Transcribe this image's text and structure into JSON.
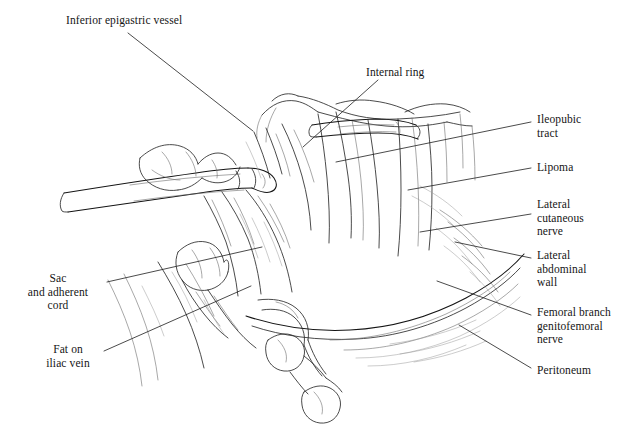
{
  "figure": {
    "background_color": "#ffffff",
    "ink_color": "#1a1a1a",
    "width": 625,
    "height": 438
  },
  "labels": [
    {
      "id": "inferior-epigastric-vessel",
      "text": "Inferior epigastric vessel",
      "x": 66,
      "y": 14,
      "align": "left",
      "width": 150
    },
    {
      "id": "internal-ring",
      "text": "Internal ring",
      "x": 366,
      "y": 66,
      "align": "left",
      "width": 90
    },
    {
      "id": "ileopubic-tract",
      "text": "Ileopubic\ntract",
      "x": 537,
      "y": 113,
      "align": "left",
      "width": 80
    },
    {
      "id": "lipoma",
      "text": "Lipoma",
      "x": 537,
      "y": 161,
      "align": "left",
      "width": 80
    },
    {
      "id": "lateral-cutaneous-nerve",
      "text": "Lateral\ncutaneous\nnerve",
      "x": 537,
      "y": 198,
      "align": "left",
      "width": 80
    },
    {
      "id": "lateral-abdominal-wall",
      "text": "Lateral\nabdominal\nwall",
      "x": 537,
      "y": 249,
      "align": "left",
      "width": 80
    },
    {
      "id": "femoral-branch-genitofemoral-nerve",
      "text": "Femoral branch\ngenitofemoral\nnerve",
      "x": 537,
      "y": 306,
      "align": "left",
      "width": 88
    },
    {
      "id": "peritoneum",
      "text": "Peritoneum",
      "x": 537,
      "y": 364,
      "align": "left",
      "width": 80
    },
    {
      "id": "sac-and-adherent-cord",
      "text": "Sac\nand adherent\ncord",
      "x": 12,
      "y": 272,
      "align": "center",
      "width": 92
    },
    {
      "id": "fat-on-iliac-vein",
      "text": "Fat on\niliac vein",
      "x": 30,
      "y": 343,
      "align": "center",
      "width": 76
    }
  ],
  "leader_lines": [
    {
      "id": "leader-inferior-epigastric-vessel",
      "from": [
        128,
        33
      ],
      "to": [
        253,
        131
      ]
    },
    {
      "id": "leader-internal-ring",
      "from": [
        378,
        80
      ],
      "to": [
        303,
        147
      ]
    },
    {
      "id": "leader-ileopubic-tract",
      "from": [
        531,
        122
      ],
      "to": [
        336,
        162
      ]
    },
    {
      "id": "leader-lipoma",
      "from": [
        531,
        168
      ],
      "to": [
        408,
        190
      ]
    },
    {
      "id": "leader-lateral-cutaneous-nerve",
      "from": [
        531,
        214
      ],
      "to": [
        420,
        232
      ]
    },
    {
      "id": "leader-lateral-abdominal-wall",
      "from": [
        531,
        258
      ],
      "to": [
        455,
        242
      ]
    },
    {
      "id": "leader-femoral-branch",
      "from": [
        531,
        315
      ],
      "to": [
        437,
        281
      ]
    },
    {
      "id": "leader-peritoneum",
      "from": [
        531,
        368
      ],
      "to": [
        459,
        325
      ]
    },
    {
      "id": "leader-sac-and-adherent-cord",
      "from": [
        107,
        282
      ],
      "to": [
        262,
        247
      ]
    },
    {
      "id": "leader-fat-on-iliac-vein",
      "from": [
        104,
        351
      ],
      "to": [
        251,
        286
      ]
    }
  ],
  "structures": [
    {
      "id": "grasper-instrument-left",
      "name": "laparoscopic grasper shaft"
    },
    {
      "id": "grasper-instrument-upper",
      "name": "laparoscopic grasper jaw"
    },
    {
      "id": "hernia-sac",
      "name": "hernia sac with adherent cord"
    },
    {
      "id": "peritoneal-edge",
      "name": "cut edge of peritoneum"
    },
    {
      "id": "spermatic-vessels",
      "name": "spermatic vessels"
    },
    {
      "id": "vas-deferens",
      "name": "vas deferens with lobules"
    },
    {
      "id": "abdominal-wall-fascia",
      "name": "lateral abdominal wall fascia"
    }
  ]
}
